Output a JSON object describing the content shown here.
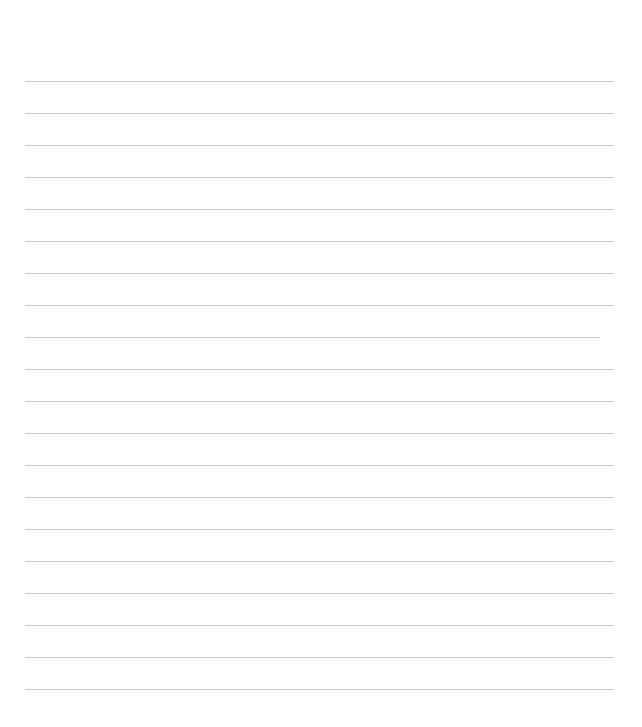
{
  "page": {
    "background": "#ffffff",
    "line_color": "#c9c9c9",
    "line_count": 20,
    "lines": [
      {
        "y": 81,
        "x1": 25,
        "x2": 614
      },
      {
        "y": 113,
        "x1": 25,
        "x2": 614
      },
      {
        "y": 145,
        "x1": 25,
        "x2": 614
      },
      {
        "y": 177,
        "x1": 25,
        "x2": 614
      },
      {
        "y": 209,
        "x1": 25,
        "x2": 614
      },
      {
        "y": 241,
        "x1": 25,
        "x2": 614
      },
      {
        "y": 273,
        "x1": 25,
        "x2": 614
      },
      {
        "y": 305,
        "x1": 25,
        "x2": 614
      },
      {
        "y": 337,
        "x1": 25,
        "x2": 600
      },
      {
        "y": 369,
        "x1": 25,
        "x2": 614
      },
      {
        "y": 401,
        "x1": 25,
        "x2": 614
      },
      {
        "y": 433,
        "x1": 25,
        "x2": 614
      },
      {
        "y": 465,
        "x1": 25,
        "x2": 614
      },
      {
        "y": 497,
        "x1": 25,
        "x2": 614
      },
      {
        "y": 529,
        "x1": 25,
        "x2": 614
      },
      {
        "y": 561,
        "x1": 25,
        "x2": 614
      },
      {
        "y": 593,
        "x1": 25,
        "x2": 614
      },
      {
        "y": 625,
        "x1": 25,
        "x2": 614
      },
      {
        "y": 657,
        "x1": 25,
        "x2": 614
      },
      {
        "y": 689,
        "x1": 25,
        "x2": 614
      }
    ]
  }
}
